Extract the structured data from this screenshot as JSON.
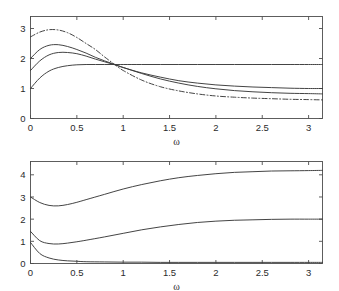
{
  "figure": {
    "title": "",
    "background_color": "#ffffff",
    "line_color": "#3a3a3a",
    "axis_color": "#4d4d4d",
    "panel_count": 2
  },
  "chart_data": [
    {
      "type": "line",
      "panel": "top",
      "title": "",
      "subtitle": "",
      "xlabel": "ω",
      "ylabel": "",
      "xlim": [
        0,
        3.15
      ],
      "ylim": [
        0,
        3.4
      ],
      "xticks": [
        0,
        0.5,
        1,
        1.5,
        2,
        2.5,
        3
      ],
      "xticklabels": [
        "0",
        "0.5",
        "1",
        "1.5",
        "2",
        "2.5",
        "3"
      ],
      "yticks": [
        0,
        1,
        2,
        3
      ],
      "yticklabels": [
        "0",
        "1",
        "2",
        "3"
      ],
      "grid": false,
      "legend": null,
      "annotations": [],
      "crossing_point": {
        "x": 0.9,
        "y": 1.8
      },
      "series": [
        {
          "name": "curve-1-dashdot",
          "style": "dash-dot",
          "x": [
            0,
            0.1,
            0.2,
            0.3,
            0.4,
            0.5,
            0.6,
            0.7,
            0.8,
            0.9,
            1.0,
            1.2,
            1.4,
            1.6,
            1.8,
            2.0,
            2.2,
            2.4,
            2.6,
            2.8,
            3.0,
            3.15
          ],
          "values": [
            2.72,
            2.88,
            2.96,
            2.95,
            2.86,
            2.7,
            2.5,
            2.3,
            2.05,
            1.82,
            1.6,
            1.28,
            1.06,
            0.92,
            0.82,
            0.75,
            0.71,
            0.68,
            0.66,
            0.64,
            0.63,
            0.62
          ]
        },
        {
          "name": "curve-2-solid",
          "style": "solid",
          "x": [
            0,
            0.1,
            0.2,
            0.3,
            0.4,
            0.5,
            0.6,
            0.7,
            0.8,
            0.9,
            1.0,
            1.2,
            1.4,
            1.6,
            1.8,
            2.0,
            2.2,
            2.4,
            2.6,
            2.8,
            3.0,
            3.15
          ],
          "values": [
            2.0,
            2.3,
            2.44,
            2.46,
            2.4,
            2.3,
            2.18,
            2.04,
            1.92,
            1.81,
            1.7,
            1.52,
            1.38,
            1.26,
            1.18,
            1.12,
            1.08,
            1.05,
            1.03,
            1.01,
            1.0,
            1.0
          ]
        },
        {
          "name": "curve-3-solid",
          "style": "solid",
          "x": [
            0,
            0.1,
            0.2,
            0.3,
            0.4,
            0.5,
            0.6,
            0.7,
            0.8,
            0.9,
            1.0,
            1.2,
            1.4,
            1.6,
            1.8,
            2.0,
            2.2,
            2.4,
            2.6,
            2.8,
            3.0,
            3.15
          ],
          "values": [
            1.6,
            1.92,
            2.12,
            2.2,
            2.2,
            2.16,
            2.08,
            1.98,
            1.89,
            1.8,
            1.7,
            1.5,
            1.32,
            1.18,
            1.07,
            0.99,
            0.93,
            0.89,
            0.86,
            0.84,
            0.83,
            0.82
          ]
        },
        {
          "name": "curve-4-solid",
          "style": "solid",
          "x": [
            0,
            0.1,
            0.2,
            0.3,
            0.4,
            0.5,
            0.6,
            0.7,
            0.8,
            0.9,
            1.0,
            1.2,
            1.4,
            1.6,
            1.8,
            2.0,
            2.2,
            2.4,
            2.6,
            2.8,
            3.0,
            3.15
          ],
          "values": [
            1.0,
            1.35,
            1.58,
            1.7,
            1.76,
            1.79,
            1.8,
            1.8,
            1.8,
            1.8,
            1.8,
            1.8,
            1.8,
            1.8,
            1.8,
            1.8,
            1.8,
            1.8,
            1.8,
            1.8,
            1.8,
            1.8
          ]
        }
      ]
    },
    {
      "type": "line",
      "panel": "bottom",
      "title": "",
      "subtitle": "",
      "xlabel": "ω",
      "ylabel": "",
      "xlim": [
        0,
        3.15
      ],
      "ylim": [
        0,
        4.6
      ],
      "xticks": [
        0,
        0.5,
        1,
        1.5,
        2,
        2.5,
        3
      ],
      "xticklabels": [
        "0",
        "0.5",
        "1",
        "1.5",
        "2",
        "2.5",
        "3"
      ],
      "yticks": [
        0,
        1,
        2,
        3,
        4
      ],
      "yticklabels": [
        "0",
        "1",
        "2",
        "3",
        "4"
      ],
      "grid": false,
      "legend": null,
      "annotations": [],
      "series": [
        {
          "name": "curve-1-solid",
          "style": "solid",
          "x": [
            0,
            0.1,
            0.2,
            0.3,
            0.4,
            0.5,
            0.6,
            0.8,
            1.0,
            1.2,
            1.4,
            1.6,
            1.8,
            2.0,
            2.2,
            2.4,
            2.6,
            2.8,
            3.0,
            3.15
          ],
          "values": [
            3.0,
            2.75,
            2.62,
            2.6,
            2.66,
            2.76,
            2.88,
            3.12,
            3.36,
            3.56,
            3.73,
            3.87,
            3.97,
            4.05,
            4.11,
            4.14,
            4.17,
            4.18,
            4.19,
            4.2
          ]
        },
        {
          "name": "curve-2-solid",
          "style": "solid",
          "x": [
            0,
            0.1,
            0.2,
            0.3,
            0.4,
            0.5,
            0.6,
            0.8,
            1.0,
            1.2,
            1.4,
            1.6,
            1.8,
            2.0,
            2.2,
            2.4,
            2.6,
            2.8,
            3.0,
            3.15
          ],
          "values": [
            1.45,
            1.03,
            0.9,
            0.88,
            0.92,
            0.98,
            1.05,
            1.2,
            1.36,
            1.52,
            1.65,
            1.76,
            1.85,
            1.91,
            1.95,
            1.97,
            1.99,
            2.0,
            2.0,
            2.0
          ]
        },
        {
          "name": "curve-3-solid",
          "style": "solid",
          "x": [
            0,
            0.1,
            0.2,
            0.3,
            0.4,
            0.5,
            0.6,
            0.8,
            1.0,
            1.2,
            1.4,
            1.6,
            1.8,
            2.0,
            2.2,
            2.4,
            2.6,
            2.8,
            3.0,
            3.15
          ],
          "values": [
            0.95,
            0.45,
            0.25,
            0.16,
            0.12,
            0.1,
            0.08,
            0.07,
            0.06,
            0.06,
            0.05,
            0.05,
            0.05,
            0.05,
            0.05,
            0.05,
            0.05,
            0.05,
            0.05,
            0.05
          ]
        }
      ]
    }
  ]
}
